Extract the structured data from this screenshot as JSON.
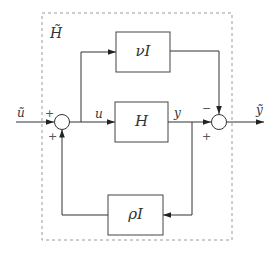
{
  "diagram": {
    "type": "block-diagram",
    "outer_box": {
      "label": "H̃",
      "style": "dashed"
    },
    "signals": {
      "input": "ũ",
      "internal_u": "u",
      "internal_y": "y",
      "output": "ỹ"
    },
    "blocks": [
      {
        "id": "nu",
        "label": "νI"
      },
      {
        "id": "H",
        "label": "H"
      },
      {
        "id": "rho",
        "label": "ρI"
      }
    ],
    "junctions": {
      "left": {
        "signs": {
          "top_left": "+",
          "bottom": "+"
        }
      },
      "right": {
        "signs": {
          "top": "−",
          "bottom_left": "+"
        }
      }
    },
    "colors": {
      "line": "#333333",
      "dashed_box": "#999999",
      "block_border": "#444444"
    }
  }
}
